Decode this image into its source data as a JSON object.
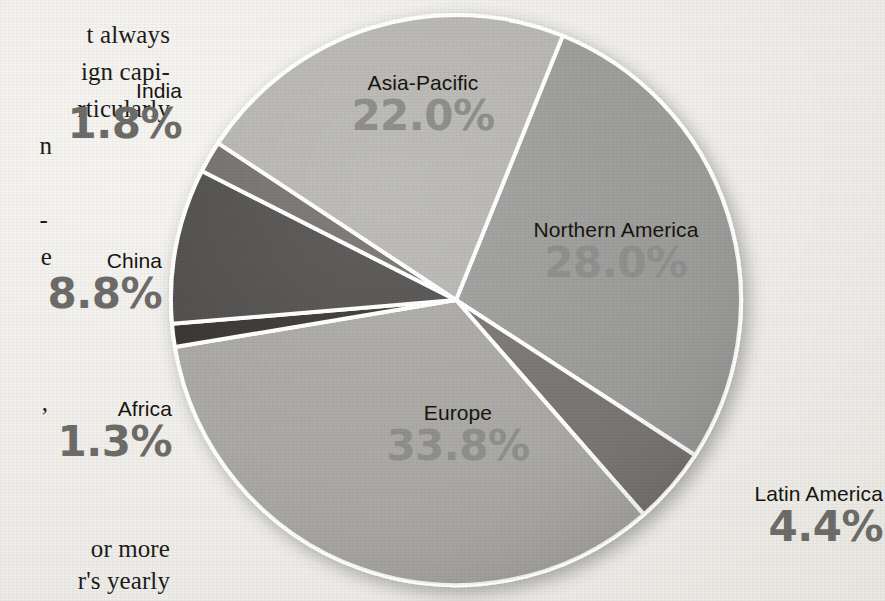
{
  "chart_data": {
    "type": "pie",
    "title": "",
    "unit": "%",
    "start_angle_deg": 22,
    "direction": "clockwise",
    "legend": "none",
    "labels_inline": true,
    "categories": [
      "Northern America",
      "Latin America",
      "Europe",
      "Africa",
      "China",
      "India",
      "Asia-Pacific"
    ],
    "values": [
      28.0,
      4.4,
      33.8,
      1.3,
      8.8,
      1.8,
      22.0
    ],
    "slices": [
      {
        "name": "Northern America",
        "value": 28.0,
        "value_label": "28.0%",
        "color": "#9a9a98",
        "start_deg": 22,
        "end_deg": 123.0
      },
      {
        "name": "Latin America",
        "value": 4.4,
        "value_label": "4.4%",
        "color": "#76736f",
        "start_deg": 123.0,
        "end_deg": 138.8
      },
      {
        "name": "Europe",
        "value": 33.8,
        "value_label": "33.8%",
        "color": "#a8a7a3",
        "start_deg": 138.8,
        "end_deg": 260.5
      },
      {
        "name": "Africa",
        "value": 1.3,
        "value_label": "1.3%",
        "color": "#35332f",
        "start_deg": 260.5,
        "end_deg": 265.2
      },
      {
        "name": "China",
        "value": 8.8,
        "value_label": "8.8%",
        "color": "#4e4c49",
        "start_deg": 265.2,
        "end_deg": 296.9
      },
      {
        "name": "India",
        "value": 1.8,
        "value_label": "1.8%",
        "color": "#6f6d69",
        "start_deg": 296.9,
        "end_deg": 303.4
      },
      {
        "name": "Asia-Pacific",
        "value": 22.0,
        "value_label": "22.0%",
        "color": "#b5b4b0",
        "start_deg": 303.4,
        "end_deg": 382.0
      }
    ],
    "xlabel": "",
    "ylabel": ""
  },
  "labels": {
    "asia_pacific": {
      "name": "Asia-Pacific",
      "pct": "22.0%"
    },
    "northern_america": {
      "name": "Northern America",
      "pct": "28.0%"
    },
    "europe": {
      "name": "Europe",
      "pct": "33.8%"
    },
    "latin_america": {
      "name": "Latin America",
      "pct": "4.4%"
    },
    "india": {
      "name": "India",
      "pct": "1.8%"
    },
    "china": {
      "name": "China",
      "pct": "8.8%"
    },
    "africa": {
      "name": "Africa",
      "pct": "1.3%"
    }
  },
  "body_text": {
    "lines": [
      "t always",
      "ign capi-",
      "rticularly",
      "n",
      "",
      "-",
      "e",
      ",",
      "or more",
      "r's yearly"
    ]
  },
  "colors": {
    "paper": "#efeeea",
    "slice_separator": "#ffffff",
    "label_text": "#17150f",
    "pct_on_slice": "#8f8f8d",
    "pct_off_slice": "#6e6c69"
  }
}
